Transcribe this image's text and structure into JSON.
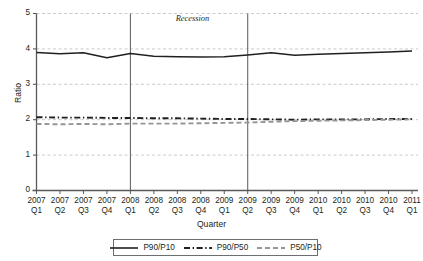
{
  "chart_data": {
    "type": "line",
    "title": "",
    "xlabel": "Quarter",
    "ylabel": "Ratio",
    "ylim": [
      0,
      5
    ],
    "yticks": [
      0,
      1,
      2,
      3,
      4,
      5
    ],
    "grid": "horizontal-dashed",
    "legend_position": "bottom",
    "categories": [
      "2007 Q1",
      "2007 Q2",
      "2007 Q3",
      "2007 Q4",
      "2008 Q1",
      "2008 Q2",
      "2008 Q3",
      "2008 Q4",
      "2009 Q1",
      "2009 Q2",
      "2009 Q3",
      "2009 Q4",
      "2010 Q1",
      "2010 Q2",
      "2010 Q3",
      "2010 Q4",
      "2011 Q1"
    ],
    "series": [
      {
        "name": "P90/P10",
        "style": "solid",
        "color": "#231f20",
        "values": [
          3.9,
          3.86,
          3.89,
          3.75,
          3.87,
          3.79,
          3.78,
          3.77,
          3.78,
          3.83,
          3.89,
          3.82,
          3.85,
          3.87,
          3.89,
          3.91,
          3.94
        ]
      },
      {
        "name": "P90/P50",
        "style": "dash-dot",
        "color": "#231f20",
        "values": [
          2.07,
          2.06,
          2.06,
          2.05,
          2.05,
          2.04,
          2.04,
          2.03,
          2.02,
          2.02,
          2.01,
          2.0,
          2.01,
          2.01,
          2.01,
          2.02,
          2.02
        ]
      },
      {
        "name": "P50/P10",
        "style": "dashed",
        "color": "#939598",
        "values": [
          1.88,
          1.87,
          1.88,
          1.87,
          1.89,
          1.89,
          1.89,
          1.9,
          1.91,
          1.92,
          1.94,
          1.96,
          1.97,
          1.98,
          1.99,
          2.0,
          2.01
        ]
      }
    ],
    "annotations": [
      {
        "name": "recession",
        "label": "Recession",
        "start_category": "2008 Q1",
        "end_category": "2009 Q2"
      }
    ]
  },
  "axes": {
    "y_title": "Ratio",
    "x_title": "Quarter",
    "y_tick_labels": [
      "5",
      "4",
      "3",
      "2",
      "1",
      "0"
    ],
    "x_tick_years": [
      "2007",
      "2007",
      "2007",
      "2007",
      "2008",
      "2008",
      "2008",
      "2008",
      "2009",
      "2009",
      "2009",
      "2009",
      "2010",
      "2010",
      "2010",
      "2010",
      "2011"
    ],
    "x_tick_quarters": [
      "Q1",
      "Q2",
      "Q3",
      "Q4",
      "Q1",
      "Q2",
      "Q3",
      "Q4",
      "Q1",
      "Q2",
      "Q3",
      "Q4",
      "Q1",
      "Q2",
      "Q3",
      "Q4",
      "Q1"
    ]
  },
  "annotation": {
    "recession_label": "Recession"
  },
  "legend": {
    "items": [
      {
        "label": "P90/P10",
        "style": "solid",
        "color": "#231f20"
      },
      {
        "label": "P90/P50",
        "style": "dash-dot",
        "color": "#231f20"
      },
      {
        "label": "P50/P10",
        "style": "dashed",
        "color": "#939598"
      }
    ]
  },
  "colors": {
    "axis": "#58595b",
    "grid": "#bcbec0",
    "ink": "#231f20",
    "gray_series": "#939598",
    "legend_border": "#6d6e71",
    "background": "#ffffff"
  }
}
